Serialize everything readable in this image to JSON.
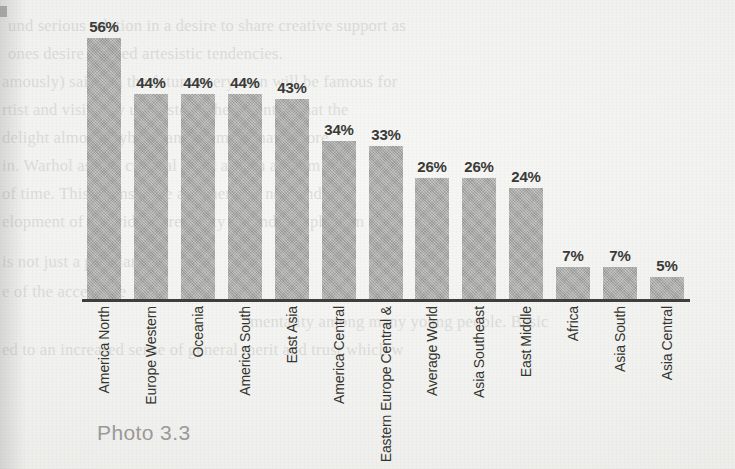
{
  "caption": "Photo 3.3",
  "colors": {
    "bar_fill": "#a9a9a7",
    "axis": "#3f3f3d",
    "value_label": "#3a3a38",
    "category_label": "#35352f",
    "caption": "#9b9b99",
    "paper": "#f3f3f1"
  },
  "chart_data": {
    "type": "bar",
    "title": "",
    "xlabel": "",
    "ylabel": "",
    "ylim": [
      0,
      60
    ],
    "grid": false,
    "legend": "none",
    "value_suffix": "%",
    "categories": [
      "North America",
      "Western Europe",
      "Oceania",
      "South America",
      "East Asia",
      "Central America",
      "Central & Eastern Europe",
      "World Average",
      "Southeast Asia",
      "Middle East",
      "Africa",
      "South Asia",
      "Central Asia"
    ],
    "category_lines": [
      [
        "North",
        "America"
      ],
      [
        "Western",
        "Europe"
      ],
      [
        "Oceania"
      ],
      [
        "South",
        "America"
      ],
      [
        "East Asia"
      ],
      [
        "Central",
        "America"
      ],
      [
        "Central &",
        "Eastern Europe"
      ],
      [
        "World",
        "Average"
      ],
      [
        "Southeast",
        "Asia"
      ],
      [
        "Middle",
        "East"
      ],
      [
        "Africa"
      ],
      [
        "South",
        "Asia"
      ],
      [
        "Central",
        "Asia"
      ]
    ],
    "values": [
      56,
      44,
      44,
      44,
      43,
      34,
      33,
      26,
      26,
      24,
      7,
      7,
      5
    ],
    "value_labels": [
      "56%",
      "44%",
      "44%",
      "44%",
      "43%",
      "34%",
      "33%",
      "26%",
      "26%",
      "24%",
      "7%",
      "7%",
      "5%"
    ]
  },
  "ghost_text": {
    "lines": [
      {
        "text": "und serious relation in a desire to share creative support as",
        "x": 8,
        "y": 16,
        "mirror": false
      },
      {
        "text": "ones desire to need artesistic tendencies.",
        "x": 8,
        "y": 44,
        "mirror": false
      },
      {
        "text": "amously) said, 'In the future every man will be famous for",
        "x": 2,
        "y": 72,
        "mirror": false
      },
      {
        "text": "rtist and visionary understood the potential that the",
        "x": 2,
        "y": 100,
        "mirror": false
      },
      {
        "text": "delight almost anybody and seems to have more",
        "x": 2,
        "y": 128,
        "mirror": false
      },
      {
        "text": "in. Warhol as in a cultural trend and an artform",
        "x": 2,
        "y": 156,
        "mirror": false
      },
      {
        "text": "of time. This seems to be an emerging new and",
        "x": 2,
        "y": 184,
        "mirror": false
      },
      {
        "text": "elopment of individual creativity around this phenom",
        "x": 2,
        "y": 212,
        "mirror": false
      },
      {
        "text": "is not just a popular",
        "x": 2,
        "y": 252,
        "mirror": false
      },
      {
        "text": "e of the accessible",
        "x": 2,
        "y": 282,
        "mirror": false
      },
      {
        "text": "mentality among many young people. Basic",
        "x": 250,
        "y": 312,
        "mirror": false
      },
      {
        "text": "ed to an increased sense of general merit and trust which w",
        "x": 2,
        "y": 340,
        "mirror": false
      }
    ]
  }
}
